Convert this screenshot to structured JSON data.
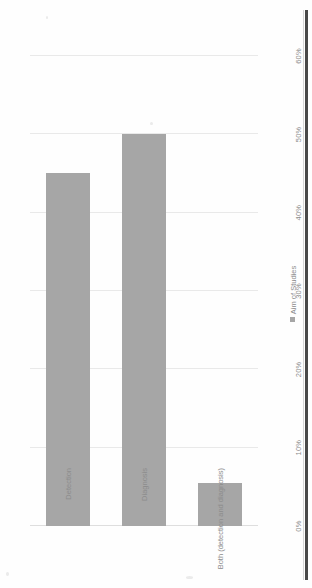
{
  "chart_data": {
    "type": "bar",
    "orientation": "horizontal",
    "title": "",
    "xlabel": "",
    "ylabel": "",
    "categories": [
      "Detection",
      "Diagnosis",
      "Both (detection and diagnosis)"
    ],
    "values": [
      45,
      50,
      5.5
    ],
    "value_labels": [
      "45%",
      "50%",
      "5.5%"
    ],
    "series": [
      {
        "name": "Aim of Studies",
        "values": [
          45,
          50,
          5.5
        ],
        "color": "#a6a6a6"
      }
    ],
    "xlim": [
      0,
      60
    ],
    "ticks": [
      0,
      10,
      20,
      30,
      40,
      50,
      60
    ],
    "tick_labels": [
      "0%",
      "10%",
      "20%",
      "30%",
      "40%",
      "50%",
      "60%"
    ],
    "grid": true,
    "legend": {
      "position": "bottom",
      "entries": [
        {
          "label": "Aim of Studies",
          "color": "#a6a6a6"
        }
      ]
    }
  },
  "colors": {
    "bar": "#a6a6a6",
    "gridline": "#e9e9e9",
    "axis": "#dedede",
    "text": "#8c8c8c",
    "scan_edge": "#3a3a3a",
    "background": "#fefefe"
  },
  "page": {
    "rotation": "-90deg",
    "scan_artifact": "dark-right-edge-bar"
  }
}
